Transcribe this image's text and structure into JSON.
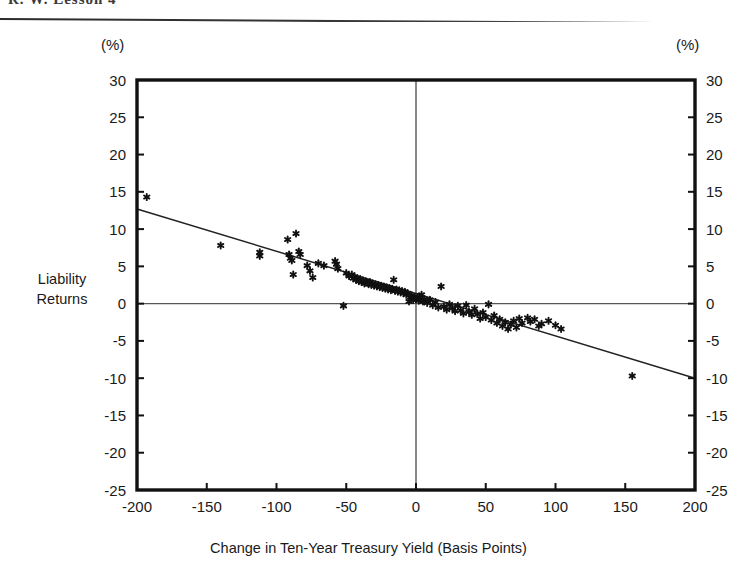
{
  "header": {
    "title": "R. W. Lesson 4"
  },
  "axis_units": {
    "left": "(%)",
    "right": "(%)"
  },
  "labels": {
    "y_axis_title_line1": "Liability",
    "y_axis_title_line2": "Returns",
    "x_axis_title": "Change in Ten-Year Treasury Yield (Basis Points)"
  },
  "colors": {
    "frame": "#111111",
    "axis_line": "#555555",
    "marker": "#111111",
    "regression": "#222222",
    "background": "#ffffff"
  },
  "chart_data": {
    "type": "scatter",
    "title": "",
    "xlabel": "Change in Ten-Year Treasury Yield (Basis Points)",
    "ylabel": "Liability Returns",
    "yunit": "(%)",
    "xlim": [
      -200,
      200
    ],
    "ylim": [
      -25,
      30
    ],
    "xticks": [
      -200,
      -150,
      -100,
      -50,
      0,
      50,
      100,
      150,
      200
    ],
    "xticklabels": [
      "-200",
      "-150",
      "-100",
      "-50",
      "0",
      "50",
      "100",
      "150",
      "200"
    ],
    "yticks": [
      -25,
      -20,
      -15,
      -10,
      -5,
      0,
      5,
      10,
      15,
      20,
      25,
      30
    ],
    "yticklabels": [
      "-25",
      "-20",
      "-15",
      "-10",
      "-5",
      "0",
      "5",
      "10",
      "15",
      "20",
      "25",
      "30"
    ],
    "grid": false,
    "legend": "none",
    "dual_y_axis": true,
    "zero_lines": {
      "horizontal": 0,
      "vertical": 0
    },
    "regression_line": {
      "x_start": -200,
      "y_start": 12.7,
      "x_end": 200,
      "y_end": -10.0,
      "slope_per_bp": -0.0568,
      "intercept": 1.35
    },
    "series": [
      {
        "name": "Liability Returns",
        "marker": "star",
        "points": [
          [
            -193,
            14.3
          ],
          [
            -140,
            7.8
          ],
          [
            -112,
            6.4
          ],
          [
            -112,
            6.9
          ],
          [
            -92,
            8.6
          ],
          [
            -91,
            6.6
          ],
          [
            -90,
            6.1
          ],
          [
            -89,
            5.8
          ],
          [
            -88,
            3.9
          ],
          [
            -86,
            9.4
          ],
          [
            -84,
            7.0
          ],
          [
            -83,
            6.6
          ],
          [
            -78,
            5.1
          ],
          [
            -76,
            4.4
          ],
          [
            -74,
            3.5
          ],
          [
            -70,
            5.4
          ],
          [
            -66,
            5.1
          ],
          [
            -58,
            5.7
          ],
          [
            -57,
            5.3
          ],
          [
            -56,
            4.7
          ],
          [
            -52,
            -0.3
          ],
          [
            -50,
            4.1
          ],
          [
            -48,
            3.7
          ],
          [
            -46,
            3.9
          ],
          [
            -45,
            3.4
          ],
          [
            -44,
            3.6
          ],
          [
            -43,
            3.2
          ],
          [
            -42,
            3.4
          ],
          [
            -41,
            3.0
          ],
          [
            -40,
            3.3
          ],
          [
            -39,
            2.9
          ],
          [
            -38,
            3.1
          ],
          [
            -37,
            2.7
          ],
          [
            -36,
            3.0
          ],
          [
            -35,
            2.8
          ],
          [
            -34,
            2.6
          ],
          [
            -33,
            2.9
          ],
          [
            -32,
            2.5
          ],
          [
            -31,
            2.7
          ],
          [
            -30,
            2.4
          ],
          [
            -29,
            2.6
          ],
          [
            -28,
            2.3
          ],
          [
            -27,
            2.5
          ],
          [
            -26,
            2.2
          ],
          [
            -25,
            2.4
          ],
          [
            -24,
            2.1
          ],
          [
            -23,
            2.3
          ],
          [
            -22,
            2.0
          ],
          [
            -21,
            2.2
          ],
          [
            -20,
            1.9
          ],
          [
            -19,
            2.1
          ],
          [
            -18,
            1.8
          ],
          [
            -17,
            2.0
          ],
          [
            -16,
            3.2
          ],
          [
            -15,
            1.7
          ],
          [
            -14,
            1.9
          ],
          [
            -13,
            1.6
          ],
          [
            -12,
            1.8
          ],
          [
            -11,
            1.5
          ],
          [
            -10,
            1.7
          ],
          [
            -9,
            1.4
          ],
          [
            -8,
            1.6
          ],
          [
            -7,
            1.2
          ],
          [
            -6,
            1.4
          ],
          [
            -5,
            0.3
          ],
          [
            -4,
            0.9
          ],
          [
            -3,
            1.1
          ],
          [
            -2,
            0.5
          ],
          [
            -1,
            0.8
          ],
          [
            0,
            0.6
          ],
          [
            1,
            0.9
          ],
          [
            2,
            0.4
          ],
          [
            3,
            0.7
          ],
          [
            4,
            1.2
          ],
          [
            5,
            0.3
          ],
          [
            6,
            0.6
          ],
          [
            8,
            0.1
          ],
          [
            10,
            0.5
          ],
          [
            12,
            -0.2
          ],
          [
            14,
            0.2
          ],
          [
            16,
            -0.5
          ],
          [
            18,
            2.3
          ],
          [
            20,
            -0.4
          ],
          [
            22,
            -0.8
          ],
          [
            24,
            -0.1
          ],
          [
            26,
            -0.6
          ],
          [
            28,
            -1.0
          ],
          [
            30,
            -0.3
          ],
          [
            32,
            -0.9
          ],
          [
            34,
            -1.3
          ],
          [
            36,
            -0.2
          ],
          [
            38,
            -1.1
          ],
          [
            40,
            -1.5
          ],
          [
            42,
            -0.7
          ],
          [
            44,
            -1.4
          ],
          [
            46,
            -2.0
          ],
          [
            48,
            -1.2
          ],
          [
            50,
            -1.8
          ],
          [
            52,
            -0.1
          ],
          [
            54,
            -2.2
          ],
          [
            56,
            -1.6
          ],
          [
            58,
            -2.6
          ],
          [
            60,
            -2.1
          ],
          [
            62,
            -3.0
          ],
          [
            64,
            -2.5
          ],
          [
            66,
            -3.4
          ],
          [
            68,
            -2.8
          ],
          [
            70,
            -2.3
          ],
          [
            72,
            -3.2
          ],
          [
            74,
            -2.0
          ],
          [
            76,
            -2.6
          ],
          [
            80,
            -1.9
          ],
          [
            82,
            -2.4
          ],
          [
            85,
            -2.1
          ],
          [
            88,
            -3.0
          ],
          [
            90,
            -2.7
          ],
          [
            95,
            -2.3
          ],
          [
            100,
            -2.9
          ],
          [
            104,
            -3.4
          ],
          [
            155,
            -9.7
          ]
        ]
      }
    ]
  }
}
